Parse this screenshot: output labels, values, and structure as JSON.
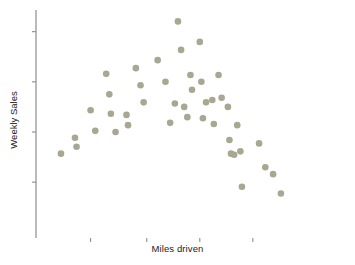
{
  "chart_data": {
    "type": "scatter",
    "title": "",
    "xlabel": "Miles driven",
    "ylabel": "Weekly Sales",
    "grid": false,
    "legend": null,
    "xlim": [
      0,
      100
    ],
    "ylim": [
      0,
      100
    ],
    "x_tick_labels": [],
    "y_tick_labels": [],
    "x_tick_positions": [
      17.5,
      35.5,
      52.5,
      69.5
    ],
    "y_tick_positions": [
      90.5,
      68.5,
      46.5,
      24.5
    ],
    "marker": {
      "shape": "circle",
      "color": "#a9a692",
      "size": 4.6
    },
    "axis_color": "#8c8c8c",
    "axis_accent_color": "#9d8fa6",
    "n_points": 45,
    "relationship": "inverted-U / curvilinear (sales rise then fall as miles driven increase)",
    "points": [
      {
        "x": 8.0,
        "y": 37.0
      },
      {
        "x": 12.5,
        "y": 44.0
      },
      {
        "x": 13.0,
        "y": 40.0
      },
      {
        "x": 17.5,
        "y": 56.0
      },
      {
        "x": 19.0,
        "y": 47.0
      },
      {
        "x": 22.5,
        "y": 72.0
      },
      {
        "x": 23.5,
        "y": 63.0
      },
      {
        "x": 24.0,
        "y": 54.5
      },
      {
        "x": 25.5,
        "y": 46.5
      },
      {
        "x": 29.0,
        "y": 54.0
      },
      {
        "x": 29.5,
        "y": 49.5
      },
      {
        "x": 32.0,
        "y": 74.5
      },
      {
        "x": 33.5,
        "y": 67.0
      },
      {
        "x": 34.5,
        "y": 59.5
      },
      {
        "x": 39.0,
        "y": 78.0
      },
      {
        "x": 41.5,
        "y": 68.5
      },
      {
        "x": 43.0,
        "y": 50.5
      },
      {
        "x": 44.5,
        "y": 59.0
      },
      {
        "x": 45.5,
        "y": 95.0
      },
      {
        "x": 46.5,
        "y": 82.5
      },
      {
        "x": 47.5,
        "y": 57.5
      },
      {
        "x": 48.5,
        "y": 53.0
      },
      {
        "x": 49.5,
        "y": 71.5
      },
      {
        "x": 50.0,
        "y": 65.0
      },
      {
        "x": 52.5,
        "y": 86.0
      },
      {
        "x": 53.0,
        "y": 68.5
      },
      {
        "x": 53.5,
        "y": 52.5
      },
      {
        "x": 54.5,
        "y": 59.5
      },
      {
        "x": 56.5,
        "y": 60.5
      },
      {
        "x": 57.0,
        "y": 50.0
      },
      {
        "x": 58.5,
        "y": 71.5
      },
      {
        "x": 59.5,
        "y": 61.5
      },
      {
        "x": 61.5,
        "y": 57.5
      },
      {
        "x": 62.0,
        "y": 43.0
      },
      {
        "x": 62.5,
        "y": 37.0
      },
      {
        "x": 63.5,
        "y": 36.5
      },
      {
        "x": 64.5,
        "y": 49.5
      },
      {
        "x": 65.5,
        "y": 38.0
      },
      {
        "x": 66.0,
        "y": 22.5
      },
      {
        "x": 71.5,
        "y": 41.5
      },
      {
        "x": 73.5,
        "y": 31.0
      },
      {
        "x": 76.0,
        "y": 28.0
      },
      {
        "x": 78.5,
        "y": 19.5
      }
    ]
  },
  "plot_geometry": {
    "left": 36,
    "right": 348,
    "top": 10,
    "bottom": 238
  }
}
